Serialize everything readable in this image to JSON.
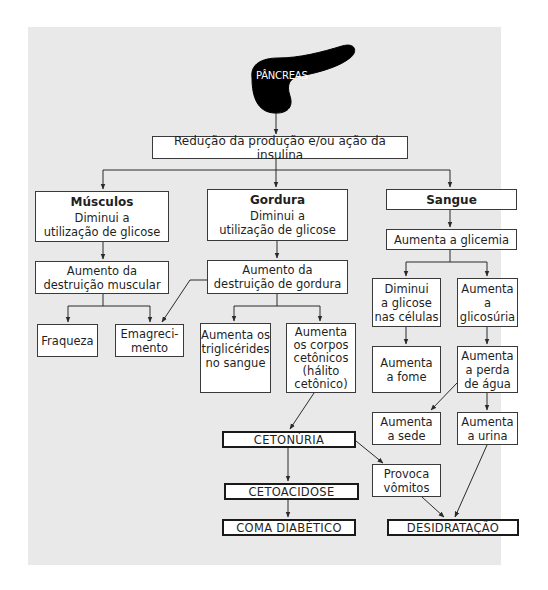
{
  "diagram": {
    "organ": {
      "label": "PÂNCREAS",
      "color": "#000000"
    },
    "root": {
      "label": "Redução da produção e/ou ação da insulina"
    },
    "branches": {
      "musculos": {
        "title": "Músculos",
        "subtitle_line1": "Diminui a",
        "subtitle_line2": "utilização de glicose",
        "effect_line1": "Aumento da",
        "effect_line2": "destruição muscular",
        "outcomes": {
          "fraqueza": "Fraqueza",
          "emagrecimento_line1": "Emagreci-",
          "emagrecimento_line2": "mento"
        }
      },
      "gordura": {
        "title": "Gordura",
        "subtitle_line1": "Diminui a",
        "subtitle_line2": "utilização de glicose",
        "effect_line1": "Aumento da",
        "effect_line2": "destruição de gordura",
        "outcomes": {
          "triglicerides": [
            "Aumenta os",
            "triglicérides",
            "no sangue"
          ],
          "corpos_cetonicos": [
            "Aumenta",
            "os corpos",
            "cetônicos",
            "(hálito",
            "cetônico)"
          ]
        }
      },
      "sangue": {
        "title": "Sangue",
        "effect": "Aumenta a glicemia",
        "diminui_glicose": [
          "Diminui",
          "a glicose",
          "nas células"
        ],
        "glicosuria": [
          "Aumenta",
          "a",
          "glicosúria"
        ],
        "fome": [
          "Aumenta",
          "a fome"
        ],
        "perda_agua": [
          "Aumenta",
          "a perda",
          "de água"
        ],
        "sede": [
          "Aumenta",
          "a sede"
        ],
        "urina": [
          "Aumenta",
          "a urina"
        ]
      }
    },
    "consequences": {
      "cetonuria": "CETONÚRIA",
      "cetoacidose": "CETOACIDOSE",
      "coma": "COMA DIABÉTICO",
      "vomitos": [
        "Provoca",
        "vômitos"
      ],
      "desidratacao": "DESIDRATAÇÃO"
    },
    "colors": {
      "panel_background": "#e9e9e9",
      "box_background": "#ffffff",
      "line": "#2a2a2a"
    }
  }
}
